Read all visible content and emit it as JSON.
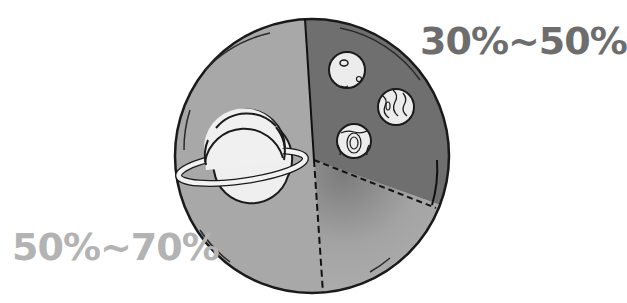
{
  "diagram": {
    "type": "pie-illustration",
    "segments": [
      {
        "id": "gas-giant",
        "label": "50%~70%",
        "icon": "saturn-planet-icon",
        "color": "#a6a6a6"
      },
      {
        "id": "rocky-planets",
        "label": "30%~50%",
        "icon": "small-planets-icon",
        "color": "#6e6e6e"
      },
      {
        "id": "remaining",
        "label": "",
        "icon": "",
        "color": "#9a9a9a"
      }
    ]
  },
  "labels": {
    "top_right": "30%~50%",
    "bottom_left": "50%~70%"
  },
  "colors": {
    "outline": "#1a1a1a",
    "label_top": "#6d6d6d",
    "label_bottom": "#b3b3b3",
    "planet_fill": "#efefef"
  }
}
